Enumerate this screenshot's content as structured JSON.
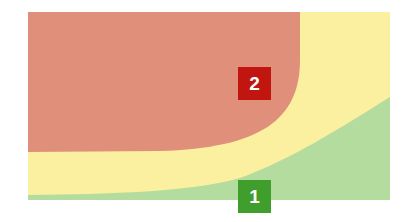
{
  "zones": [
    {
      "id": "green",
      "label": "1",
      "fill": "#b5dc9f",
      "badge_color": "#3f9e2c"
    },
    {
      "id": "yellow",
      "fill": "#fbf0a0"
    },
    {
      "id": "red",
      "label": "2",
      "fill": "#e0907a",
      "badge_color": "#c0160f"
    }
  ],
  "badges": {
    "one": "1",
    "two": "2"
  }
}
